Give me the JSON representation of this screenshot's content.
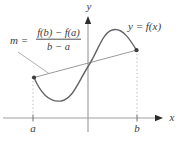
{
  "figure": {
    "labels": {
      "y_axis": "y",
      "x_axis": "x",
      "a_tick": "a",
      "b_tick": "b",
      "curve_label": "y = f(x)",
      "slope_prefix": "m =",
      "slope_numerator": "f(b) − f(a)",
      "slope_denominator": "b − a"
    },
    "colors": {
      "background": "#ffffff",
      "curve": "#646464",
      "axis": "#a0a0a0",
      "arrowhead": "#2b2b2b",
      "text": "#3a3a3a",
      "dotted_guides": "#b3b3b3",
      "secant": "#8f8f8f",
      "points": "#3d3d3d"
    }
  }
}
